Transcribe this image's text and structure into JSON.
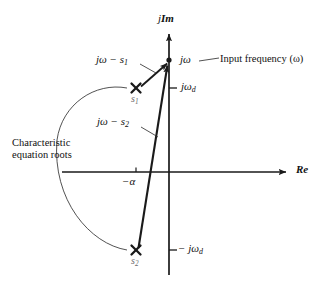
{
  "figure": {
    "type": "s-plane pole-zero vector diagram",
    "axes": {
      "imaginary_axis_label": "jℱm",
      "imaginary_axis_label_j": "j",
      "imaginary_axis_label_Im": "Im",
      "real_axis_label": "ℜe",
      "real_axis_label_Re": "Re"
    },
    "points": {
      "input_frequency_point": "jω",
      "input_frequency_point_j": "j",
      "input_frequency_point_omega": "ω"
    },
    "annotations": {
      "input_frequency_callout": "Input frequency (ω)",
      "characteristic_roots_line1": "Characteristic",
      "characteristic_roots_line2": "equation roots"
    },
    "vectors": [
      {
        "name": "vector-jw-minus-s1",
        "label": "jω − s₁",
        "label_main": "jω − s",
        "label_sub": "1",
        "from_pole": "s1",
        "to_point": "jω"
      },
      {
        "name": "vector-jw-minus-s2",
        "label": "jω − s₂",
        "label_main": "jω − s",
        "label_sub": "2",
        "from_pole": "s2",
        "to_point": "jω"
      }
    ],
    "poles": [
      {
        "name": "pole-s1",
        "label_main": "s",
        "label_sub": "1",
        "marker": "x-marker",
        "real_part": "−α",
        "imag_part": "jωd"
      },
      {
        "name": "pole-s2",
        "label_main": "s",
        "label_sub": "2",
        "marker": "x-marker",
        "real_part": "−α",
        "imag_part": "−jωd"
      }
    ],
    "ticks": {
      "alpha_tick_label_main": "−α",
      "omega_d_positive_main": "jω",
      "omega_d_positive_sub": "d",
      "omega_d_negative_main": "− jω",
      "omega_d_negative_sub": "d"
    },
    "colors": {
      "stroke": "#1a1a1a",
      "background": "#ffffff",
      "pole_label": "#6b6b6b",
      "leader": "#444444"
    }
  }
}
